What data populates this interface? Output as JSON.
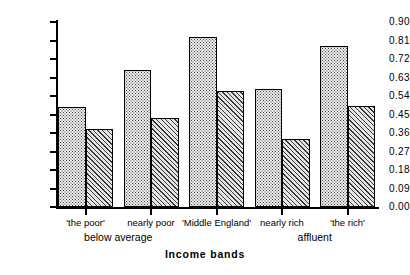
{
  "chart_data": {
    "type": "bar",
    "title": "",
    "xlabel": "Income bands",
    "ylabel": "",
    "ylim": [
      0.0,
      0.9
    ],
    "grid": false,
    "legend": "none",
    "categories": [
      "'the poor'",
      "nearly poor",
      "'Middle England'",
      "nearly rich",
      "'the rich'"
    ],
    "group_labels": [
      "below average",
      "affluent"
    ],
    "ytick_labels": [
      "0.00",
      "0.09",
      "0.18",
      "0.27",
      "0.36",
      "0.45",
      "0.54",
      "0.63",
      "0.72",
      "0.81",
      "0.90"
    ],
    "ytick_values": [
      0.0,
      0.09,
      0.18,
      0.27,
      0.36,
      0.45,
      0.54,
      0.63,
      0.72,
      0.81,
      0.9
    ],
    "series": [
      {
        "name": "series-dotted",
        "pattern": "dotted",
        "values": [
          0.485,
          0.665,
          0.825,
          0.575,
          0.785
        ]
      },
      {
        "name": "series-hatched",
        "pattern": "diagonal-hatch",
        "values": [
          0.38,
          0.435,
          0.565,
          0.33,
          0.49
        ]
      }
    ]
  },
  "axis": {
    "x_title": "Income bands"
  },
  "colors": {
    "axis": "#000000",
    "bar_outline": "#000000",
    "dotted_fill": "#ececec",
    "hatched_fill": "#e4e4e4",
    "background": "#ffffff"
  }
}
